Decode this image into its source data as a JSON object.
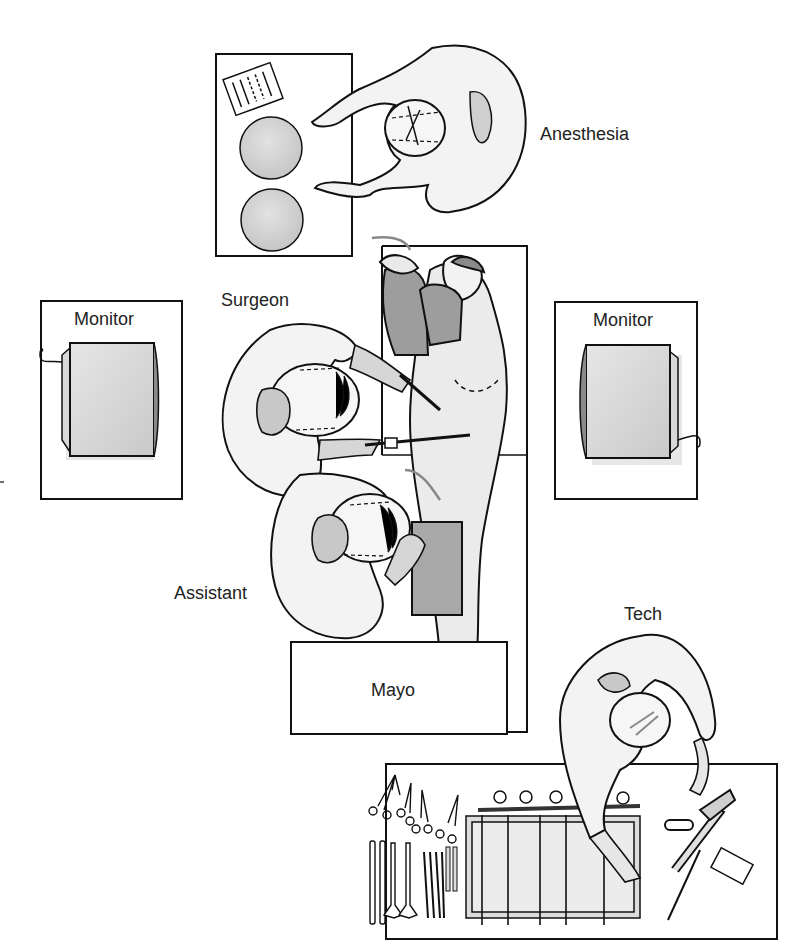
{
  "diagram": {
    "type": "operating-room-layout",
    "labels": {
      "anesthesia": "Anesthesia",
      "surgeon": "Surgeon",
      "assistant": "Assistant",
      "tech": "Tech",
      "monitor_left": "Monitor",
      "monitor_right": "Monitor",
      "mayo": "Mayo"
    },
    "colors": {
      "line": "#111111",
      "gown": "#f2f2f2",
      "skin": "#e8e8e8",
      "shade": "#bdbdbd",
      "dark_shade": "#9a9a9a",
      "background": "#ffffff"
    }
  }
}
